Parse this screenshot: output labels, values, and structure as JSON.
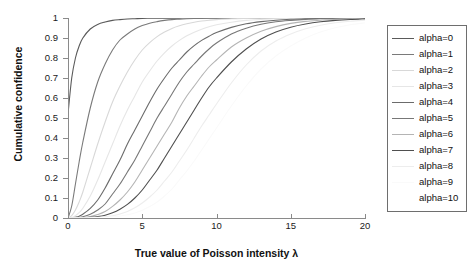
{
  "chart_data": {
    "type": "line",
    "title": "",
    "xlabel": "True value of Poisson intensity λ",
    "ylabel": "Cumulative confidence",
    "xlim": [
      0,
      20
    ],
    "ylim": [
      0,
      1
    ],
    "xticks": [
      "0",
      "5",
      "10",
      "15",
      "20"
    ],
    "xtick_values": [
      0,
      5,
      10,
      15,
      20
    ],
    "yticks": [
      "0",
      "0.1",
      "0.2",
      "0.3",
      "0.4",
      "0.5",
      "0.6",
      "0.7",
      "0.8",
      "0.9",
      "1"
    ],
    "ytick_values": [
      0,
      0.1,
      0.2,
      0.3,
      0.4,
      0.5,
      0.6,
      0.7,
      0.8,
      0.9,
      1
    ],
    "grid": false,
    "legend_position": "right-outside",
    "x": [
      0,
      0.25,
      0.5,
      0.75,
      1,
      1.5,
      2,
      2.5,
      3,
      3.5,
      4,
      4.5,
      5,
      5.5,
      6,
      6.5,
      7,
      7.5,
      8,
      8.5,
      9,
      9.5,
      10,
      11,
      12,
      13,
      14,
      15,
      16,
      17,
      18,
      19,
      20
    ],
    "series": [
      {
        "name": "alpha=0",
        "color": "#5a5a5a",
        "values": [
          0.52,
          0.7,
          0.8,
          0.86,
          0.9,
          0.945,
          0.968,
          0.98,
          0.988,
          0.992,
          0.995,
          0.9965,
          0.998,
          0.9985,
          0.999,
          0.9993,
          0.9995,
          0.9996,
          0.9997,
          0.9998,
          0.9998,
          0.9999,
          0.9999,
          0.99995,
          1,
          1,
          1,
          1,
          1,
          1,
          1,
          1,
          1
        ]
      },
      {
        "name": "alpha=1",
        "color": "#7a7a7a",
        "values": [
          0.0,
          0.06,
          0.17,
          0.28,
          0.38,
          0.55,
          0.68,
          0.77,
          0.84,
          0.89,
          0.92,
          0.945,
          0.962,
          0.974,
          0.982,
          0.988,
          0.992,
          0.994,
          0.996,
          0.9973,
          0.9982,
          0.9988,
          0.9992,
          0.9996,
          0.9998,
          0.9999,
          1,
          1,
          1,
          1,
          1,
          1,
          1
        ]
      },
      {
        "name": "alpha=2",
        "color": "#d8d8d8",
        "values": [
          0.0,
          0.012,
          0.04,
          0.08,
          0.13,
          0.25,
          0.37,
          0.48,
          0.58,
          0.66,
          0.73,
          0.79,
          0.84,
          0.877,
          0.907,
          0.93,
          0.948,
          0.961,
          0.971,
          0.979,
          0.985,
          0.989,
          0.992,
          0.9962,
          0.998,
          0.999,
          0.9995,
          0.9998,
          0.9999,
          1,
          1,
          1,
          1
        ]
      },
      {
        "name": "alpha=3",
        "color": "#e6e6e6",
        "values": [
          0.0,
          0.003,
          0.012,
          0.027,
          0.049,
          0.11,
          0.19,
          0.28,
          0.37,
          0.46,
          0.54,
          0.61,
          0.68,
          0.735,
          0.785,
          0.826,
          0.86,
          0.888,
          0.911,
          0.929,
          0.944,
          0.956,
          0.966,
          0.979,
          0.988,
          0.993,
          0.996,
          0.9978,
          0.9988,
          0.9994,
          0.9997,
          0.9998,
          0.9999
        ]
      },
      {
        "name": "alpha=4",
        "color": "#6b6b6b",
        "values": [
          0.0,
          0.001,
          0.004,
          0.009,
          0.019,
          0.048,
          0.09,
          0.15,
          0.22,
          0.29,
          0.37,
          0.44,
          0.51,
          0.58,
          0.645,
          0.7,
          0.75,
          0.79,
          0.83,
          0.862,
          0.888,
          0.909,
          0.927,
          0.953,
          0.971,
          0.982,
          0.989,
          0.9934,
          0.996,
          0.9977,
          0.9987,
          0.9993,
          0.9996
        ]
      },
      {
        "name": "alpha=5",
        "color": "#777777",
        "values": [
          0.0,
          0.0003,
          0.001,
          0.003,
          0.006,
          0.019,
          0.04,
          0.07,
          0.12,
          0.17,
          0.23,
          0.29,
          0.36,
          0.43,
          0.5,
          0.56,
          0.62,
          0.68,
          0.73,
          0.77,
          0.81,
          0.845,
          0.875,
          0.92,
          0.949,
          0.969,
          0.981,
          0.988,
          0.993,
          0.996,
          0.9977,
          0.9987,
          0.9993
        ]
      },
      {
        "name": "alpha=6",
        "color": "#b4b4b4",
        "values": [
          0.0,
          0.0001,
          0.0003,
          0.0008,
          0.002,
          0.007,
          0.017,
          0.032,
          0.058,
          0.09,
          0.13,
          0.18,
          0.24,
          0.3,
          0.36,
          0.42,
          0.48,
          0.55,
          0.61,
          0.66,
          0.71,
          0.755,
          0.79,
          0.855,
          0.9,
          0.934,
          0.957,
          0.973,
          0.983,
          0.989,
          0.994,
          0.9963,
          0.998
        ]
      },
      {
        "name": "alpha=7",
        "color": "#4f4f4f",
        "values": [
          0.0,
          3e-05,
          0.0001,
          0.0003,
          0.0007,
          0.003,
          0.007,
          0.014,
          0.026,
          0.044,
          0.068,
          0.1,
          0.14,
          0.19,
          0.24,
          0.3,
          0.36,
          0.42,
          0.48,
          0.54,
          0.6,
          0.655,
          0.7,
          0.78,
          0.845,
          0.895,
          0.93,
          0.954,
          0.97,
          0.981,
          0.988,
          0.9925,
          0.9955
        ]
      },
      {
        "name": "alpha=8",
        "color": "#ededed",
        "values": [
          0.0,
          1e-05,
          4e-05,
          0.0001,
          0.0002,
          0.001,
          0.003,
          0.006,
          0.011,
          0.02,
          0.033,
          0.051,
          0.075,
          0.105,
          0.14,
          0.185,
          0.23,
          0.285,
          0.34,
          0.4,
          0.46,
          0.515,
          0.57,
          0.675,
          0.765,
          0.835,
          0.885,
          0.92,
          0.946,
          0.964,
          0.976,
          0.984,
          0.989
        ]
      },
      {
        "name": "alpha=9",
        "color": "#fafafa",
        "values": [
          0.0,
          3e-06,
          1e-05,
          4e-05,
          0.0001,
          0.0004,
          0.001,
          0.002,
          0.005,
          0.009,
          0.016,
          0.025,
          0.039,
          0.057,
          0.08,
          0.11,
          0.145,
          0.19,
          0.235,
          0.285,
          0.34,
          0.395,
          0.45,
          0.56,
          0.66,
          0.745,
          0.81,
          0.86,
          0.9,
          0.93,
          0.951,
          0.966,
          0.976
        ]
      },
      {
        "name": "alpha=10",
        "color": "#ffffff",
        "values": [
          0.0,
          1e-06,
          3e-06,
          1e-05,
          3e-05,
          0.0001,
          0.0004,
          0.001,
          0.002,
          0.004,
          0.007,
          0.012,
          0.019,
          0.029,
          0.043,
          0.061,
          0.083,
          0.11,
          0.145,
          0.185,
          0.23,
          0.28,
          0.33,
          0.44,
          0.545,
          0.645,
          0.725,
          0.79,
          0.845,
          0.885,
          0.915,
          0.938,
          0.955
        ]
      }
    ]
  }
}
